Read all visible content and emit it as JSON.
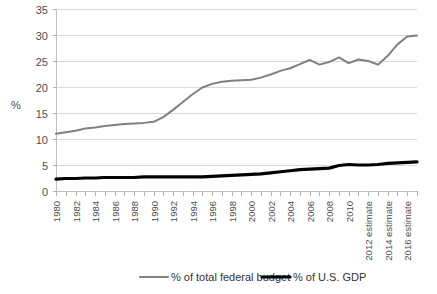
{
  "chart_data": {
    "type": "line",
    "title": "",
    "xlabel": "",
    "ylabel": "%",
    "ylim": [
      0,
      35
    ],
    "ytick_interval": 5,
    "yticks": [
      "0",
      "5",
      "10",
      "15",
      "20",
      "25",
      "30",
      "35"
    ],
    "grid": true,
    "legend_position": "bottom",
    "x": [
      "1980",
      "1981",
      "1982",
      "1983",
      "1984",
      "1985",
      "1986",
      "1987",
      "1988",
      "1989",
      "1990",
      "1991",
      "1992",
      "1993",
      "1994",
      "1995",
      "1996",
      "1997",
      "1998",
      "1999",
      "2000",
      "2001",
      "2002",
      "2003",
      "2004",
      "2005",
      "2006",
      "2007",
      "2008",
      "2009",
      "2010",
      "2011",
      "2012 estimate",
      "2013 estimate",
      "2014 estimate",
      "2015 estimate",
      "2016 estimate",
      "2017 estimate"
    ],
    "xtick_labels": [
      "1980",
      "1982",
      "1984",
      "1986",
      "1988",
      "1990",
      "1992",
      "1994",
      "1996",
      "1998",
      "2000",
      "2002",
      "2004",
      "2006",
      "2008",
      "2010",
      "2012 estimate",
      "2014 estimate",
      "2016 estimate"
    ],
    "series": [
      {
        "name": "% of total federal budget",
        "color": "#808080",
        "values": [
          11.0,
          11.3,
          11.6,
          12.0,
          12.2,
          12.5,
          12.7,
          12.9,
          13.0,
          13.1,
          13.3,
          14.2,
          15.6,
          17.1,
          18.6,
          19.9,
          20.6,
          21.0,
          21.2,
          21.3,
          21.4,
          21.8,
          22.4,
          23.1,
          23.6,
          24.4,
          25.2,
          24.3,
          24.8,
          25.7,
          24.6,
          25.3,
          25.0,
          24.3,
          26.0,
          28.2,
          29.7,
          29.9
        ]
      },
      {
        "name": "% of U.S. GDP",
        "color": "#000000",
        "values": [
          2.3,
          2.4,
          2.4,
          2.5,
          2.5,
          2.6,
          2.6,
          2.6,
          2.6,
          2.7,
          2.7,
          2.7,
          2.7,
          2.7,
          2.7,
          2.7,
          2.8,
          2.9,
          3.0,
          3.1,
          3.2,
          3.3,
          3.5,
          3.7,
          3.9,
          4.1,
          4.2,
          4.3,
          4.4,
          4.9,
          5.1,
          5.0,
          5.0,
          5.1,
          5.3,
          5.4,
          5.5,
          5.6
        ]
      }
    ],
    "legend": [
      {
        "label": "% of total federal budget",
        "color": "#808080",
        "weight": 2.0
      },
      {
        "label": "% of U.S. GDP",
        "color": "#000000",
        "weight": 3.2
      }
    ]
  }
}
